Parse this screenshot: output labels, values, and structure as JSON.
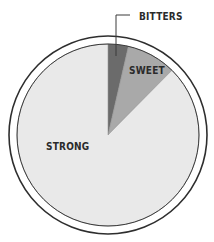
{
  "chart_data": {
    "type": "pie",
    "title": "",
    "categories": [
      "BITTERS",
      "SWEET",
      "STRONG"
    ],
    "values": [
      3.6,
      8.8,
      87.6
    ],
    "unit": "percent (estimated from slice angles)",
    "start_angle_deg": 0,
    "direction": "clockwise",
    "colors": [
      "#6b6b6b",
      "#a9a9a9",
      "#e9e9e9"
    ],
    "legend": null,
    "annotations": [
      {
        "label": "BITTERS",
        "placement": "outside, with leader line"
      },
      {
        "label": "SWEET",
        "placement": "inside slice"
      },
      {
        "label": "STRONG",
        "placement": "inside slice"
      }
    ]
  },
  "style": {
    "outline_color": "#2e2e2e",
    "ring_color": "#2e2e2e",
    "background": "#ffffff"
  }
}
